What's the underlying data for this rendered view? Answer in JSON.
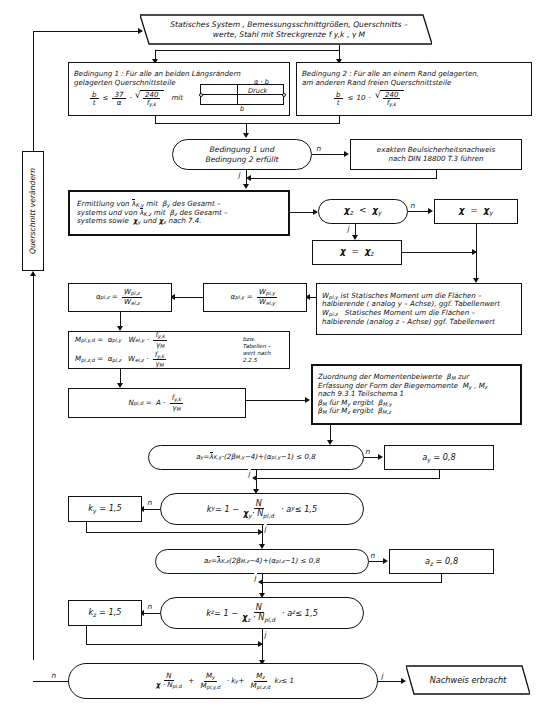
{
  "diagram": {
    "language": "de",
    "yes_label": "j",
    "no_label": "n"
  },
  "nodes": {
    "start": {
      "name": "start-terminator",
      "shape": "parallelogram",
      "line1": "Statisches System , Bemessungsschnittgrößen, Querschnitts –",
      "line2": "werte, Stahl mit Streckgrenze   f y,k  ,  γ M"
    },
    "bedingung1": {
      "name": "condition-1-box",
      "shape": "rect",
      "line1": "Bedingung 1 :  Für alle an beiden Längsrändern",
      "line2": "gelagerten Querschnittsteile",
      "formula": "b/t ≤ 37/α · √(240/f y,k)",
      "mit": "mit",
      "sketch_top": "α · b",
      "sketch_mid": "Druck",
      "sketch_bottom": "b"
    },
    "bedingung2": {
      "name": "condition-2-box",
      "shape": "rect",
      "line1": "Bedingung 2 :  Für alle an einem Rand gelagerten,",
      "line2": "am anderen  Rand freien Querschnittsteile",
      "formula": "b/t ≤ 10 · √(240/f y,k)"
    },
    "bed_erfuellt": {
      "name": "decision-conditions-fulfilled",
      "shape": "decision",
      "line1": "Bedingung 1 und",
      "line2": "Bedingung 2  erfüllt"
    },
    "beulnachweis": {
      "name": "exact-buckling-proof-box",
      "shape": "rect",
      "line1": "exakten Beulsicherheitsnachweis",
      "line2": "nach DIN 18800 T.3 führen"
    },
    "querschnitt_aendern": {
      "name": "change-cross-section-box",
      "shape": "rect",
      "label": "Querschnitt verändern"
    },
    "ermittlung": {
      "name": "slenderness-determination-box",
      "shape": "rect-double",
      "line1": "Ermittlung von  λ̄ K,y  mit  β y  des Gesamt –",
      "line2": "systems und von λ̄ K,z  mit  β z  des Gesamt –",
      "line3": "systems sowie  χ y  und  χ z  nach 7.4."
    },
    "chi_vergleich": {
      "name": "decision-chi-z-less-chi-y",
      "shape": "decision",
      "text": "χ z  <  χ y"
    },
    "chi_y": {
      "name": "chi-equals-chi-y-box",
      "shape": "rect",
      "text": "χ  =  χ y"
    },
    "chi_z": {
      "name": "chi-equals-chi-z-box",
      "shape": "rect",
      "text": "χ  =  χ z"
    },
    "alpha_pl_y": {
      "name": "alpha-pl-y-box",
      "shape": "rect",
      "text": "α pl,y  =  W pl,y / W el,y"
    },
    "alpha_pl_z": {
      "name": "alpha-pl-z-box",
      "shape": "rect",
      "text": "α pl,z  =  W pl,z / W el,z"
    },
    "wpl_info": {
      "name": "wpl-definition-box",
      "shape": "rect",
      "line1": "W pl,y  ist Statisches Moment um die Flächen –",
      "line2": "halbierende ( analog y – Achse), ggf. Tabellenwert",
      "line3": "W pl,z     Statisches  Moment um die Flächen –",
      "line4": "halbierende (analog z – Achse) ggf. Tabellenwert"
    },
    "mpl": {
      "name": "mpl-design-box",
      "shape": "rect",
      "line1": "M pl,y,d  =  α pl,y  ·  W el,y  ·  f y,k / γ M",
      "line2": "M pl,z,d  =  α pl,z  ·  W el,z  ·  f y,k / γ M",
      "note1": "bzw.",
      "note2": "Tabellen –",
      "note3": "wert nach",
      "note4": "2.2.5"
    },
    "npl": {
      "name": "npl-design-box",
      "shape": "rect",
      "text": "N pl,d  =  A ·  f y,k / γ M"
    },
    "beta_m": {
      "name": "beta-m-assignment-box",
      "shape": "rect",
      "line1": "Zuordnung der Momentenbeiwerte  β M  zur",
      "line2": "Erfassung der Form der Biegemomente  M y , M z",
      "line3": "nach  9.3.1  Teilschema 1",
      "line4": "β M  für M y  ergibt  β M,y",
      "line5": "β M  für M z  ergibt  β M,z"
    },
    "a_y_dec": {
      "name": "decision-a-y",
      "shape": "decision",
      "text": "a y  =  λ̄ K,y ·(2 β M,y −4)+(α pl,y −1) ≤ 0,8"
    },
    "a_y_set": {
      "name": "a-y-set-box",
      "shape": "rect",
      "text": "a y  =  0,8"
    },
    "k_y_dec": {
      "name": "decision-k-y",
      "shape": "decision",
      "text": "k y  =  1 −  N / (χ y · N pl,d)  ·  a y  ≤ 1,5"
    },
    "k_y_set": {
      "name": "k-y-set-box",
      "shape": "rect",
      "text": "k y  =  1,5"
    },
    "a_z_dec": {
      "name": "decision-a-z",
      "shape": "decision",
      "text": "a z  = λ̄ K,z (2 β M,z −4)+(α pl,z −1) ≤ 0,8"
    },
    "a_z_set": {
      "name": "a-z-set-box",
      "shape": "rect",
      "text": "a z  =  0,8"
    },
    "k_z_dec": {
      "name": "decision-k-z",
      "shape": "decision",
      "text": "k z  =  1 −  N / (χ z · N pl,d)  ·  a z  ≤ 1,5"
    },
    "k_z_set": {
      "name": "k-z-set-box",
      "shape": "rect",
      "text": "k z  =  1,5"
    },
    "final_dec": {
      "name": "decision-final-interaction",
      "shape": "decision",
      "text": "N/(χ · N pl,d) + M y /M pl,y,d · k y + M z /M pl,z,d · k z ≤ 1"
    },
    "end": {
      "name": "end-terminator",
      "shape": "parallelogram",
      "text": "Nachweis  erbracht"
    }
  },
  "edge_labels": {
    "bed_no": "n",
    "bed_yes": "j",
    "chi_no": "n",
    "chi_yes": "j",
    "a_y_no": "n",
    "a_y_yes": "j",
    "k_y_no": "n",
    "k_y_yes": "j",
    "a_z_no": "n",
    "a_z_yes": "j",
    "k_z_no": "n",
    "k_z_yes": "j",
    "final_no": "n",
    "final_yes": "j"
  },
  "colors": {
    "ink": "#111111",
    "paper": "#ffffff"
  }
}
